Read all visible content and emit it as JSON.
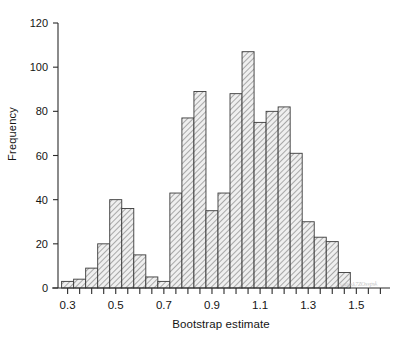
{
  "chart_data": {
    "type": "bar",
    "title": "",
    "subtitle": "",
    "xlabel": "Bootstrap estimate",
    "ylabel": "Frequency",
    "xlim": [
      0.26,
      1.64
    ],
    "ylim": [
      0,
      120
    ],
    "grid": false,
    "legend": null,
    "bin_width": 0.05,
    "bin_starts": [
      0.275,
      0.325,
      0.375,
      0.425,
      0.475,
      0.525,
      0.575,
      0.625,
      0.675,
      0.725,
      0.775,
      0.825,
      0.875,
      0.925,
      0.975,
      1.025,
      1.075,
      1.125,
      1.175,
      1.225,
      1.275,
      1.325,
      1.375,
      1.425
    ],
    "categories": [
      "0.275-0.325",
      "0.325-0.375",
      "0.375-0.425",
      "0.425-0.475",
      "0.475-0.525",
      "0.525-0.575",
      "0.575-0.625",
      "0.625-0.675",
      "0.675-0.725",
      "0.725-0.775",
      "0.775-0.825",
      "0.825-0.875",
      "0.875-0.925",
      "0.925-0.975",
      "0.975-1.025",
      "1.025-1.075",
      "1.075-1.125",
      "1.125-1.175",
      "1.175-1.225",
      "1.225-1.275",
      "1.275-1.325",
      "1.325-1.375",
      "1.375-1.425",
      "1.425-1.475"
    ],
    "values": [
      3,
      4,
      9,
      20,
      40,
      36,
      15,
      5,
      3,
      43,
      77,
      89,
      35,
      43,
      88,
      107,
      75,
      80,
      82,
      61,
      30,
      23,
      21,
      7
    ],
    "xticks_major": [
      0.3,
      0.5,
      0.7,
      0.9,
      1.1,
      1.3,
      1.5
    ],
    "xticks_major_labels": [
      "0.3",
      "0.5",
      "0.7",
      "0.9",
      "1.1",
      "1.3",
      "1.5"
    ],
    "xticks_minor": [
      0.3,
      0.35,
      0.4,
      0.45,
      0.5,
      0.55,
      0.6,
      0.65,
      0.7,
      0.75,
      0.8,
      0.85,
      0.9,
      0.95,
      1.0,
      1.05,
      1.1,
      1.15,
      1.2,
      1.25,
      1.3,
      1.35,
      1.4,
      1.45,
      1.5,
      1.55,
      1.6
    ],
    "yticks": [
      0,
      20,
      40,
      60,
      80,
      100,
      120
    ],
    "ytick_labels": [
      "0",
      "20",
      "40",
      "60",
      "80",
      "100",
      "120"
    ],
    "bar_fill": "#e8e8e8",
    "bar_hatch": "diagonal-45",
    "bar_edge": "#3a3a3a",
    "axis_color": "#2b2b2b"
  },
  "annotations": {
    "watermark_text": "soapsk7ZOsvpsk"
  }
}
